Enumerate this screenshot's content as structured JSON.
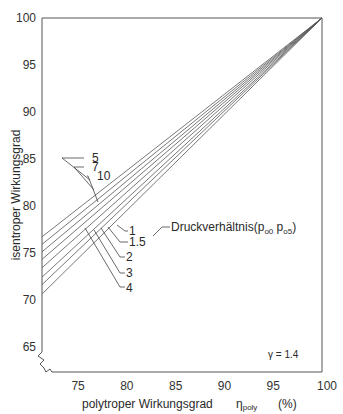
{
  "chart_data": {
    "type": "line",
    "title": "",
    "xlabel": "polytroper Wirkungsgrad",
    "xlabel_symbol": "η",
    "xlabel_symbol_sub": "poly",
    "xlabel_unit": "(%)",
    "ylabel": "isentroper Wirkungsgrad",
    "xlim": [
      71.3,
      100
    ],
    "ylim": [
      62.3,
      100
    ],
    "x_ticks": [
      75,
      80,
      85,
      90,
      95,
      100
    ],
    "y_ticks": [
      65,
      70,
      75,
      80,
      85,
      90,
      95,
      100
    ],
    "grid": false,
    "axis_break": true,
    "annotation_gamma": "γ = 1.4",
    "legend_title": "Druckverhältnis",
    "legend_title_suffix": "(p",
    "legend_sub1": "o0",
    "legend_sub2": "o5",
    "legend_close": ")",
    "series": [
      {
        "name": "10",
        "x": [
          71.3,
          100
        ],
        "y": [
          76.7,
          100
        ]
      },
      {
        "name": "7",
        "x": [
          71.3,
          100
        ],
        "y": [
          75.9,
          100
        ]
      },
      {
        "name": "5",
        "x": [
          71.3,
          100
        ],
        "y": [
          75.1,
          100
        ]
      },
      {
        "name": "4",
        "x": [
          71.3,
          100
        ],
        "y": [
          74.3,
          100
        ]
      },
      {
        "name": "3",
        "x": [
          71.3,
          100
        ],
        "y": [
          73.4,
          100
        ]
      },
      {
        "name": "2",
        "x": [
          71.3,
          100
        ],
        "y": [
          72.4,
          100
        ]
      },
      {
        "name": "1.5",
        "x": [
          71.3,
          100
        ],
        "y": [
          71.6,
          100
        ]
      },
      {
        "name": "1",
        "x": [
          71.3,
          100
        ],
        "y": [
          70.6,
          100
        ]
      }
    ],
    "upper_labels": [
      "5",
      "7",
      "10"
    ],
    "lower_labels": [
      "1",
      "1.5",
      "2",
      "3",
      "4"
    ]
  }
}
